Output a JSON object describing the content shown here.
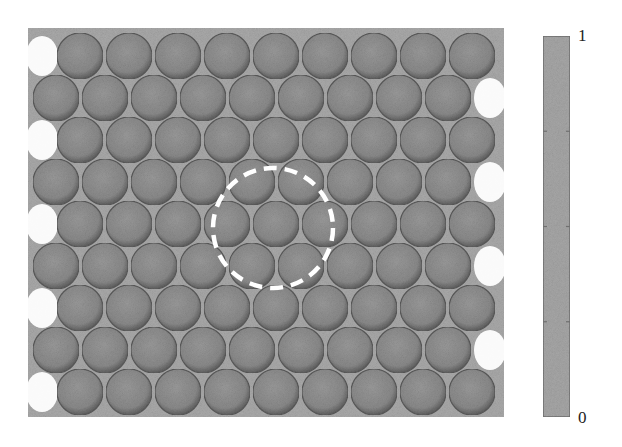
{
  "figure": {
    "title": "",
    "frame": {
      "x": 28,
      "y": 28,
      "width": 476,
      "height": 389,
      "fill": "#a9a9a9"
    },
    "sphere_color": "#8c8c8c",
    "sphere_edge_color": "#5a5a5a",
    "highlight_color": "#ffffff",
    "rows": [
      {
        "y": 56,
        "x_start": 80,
        "count": 9,
        "crescent": "left"
      },
      {
        "y": 98,
        "x_start": 56,
        "count": 9,
        "crescent": "right"
      },
      {
        "y": 140,
        "x_start": 80,
        "count": 9,
        "crescent": "left"
      },
      {
        "y": 182,
        "x_start": 56,
        "count": 9,
        "crescent": "right"
      },
      {
        "y": 224,
        "x_start": 80,
        "count": 9,
        "crescent": "left"
      },
      {
        "y": 266,
        "x_start": 56,
        "count": 9,
        "crescent": "right"
      },
      {
        "y": 308,
        "x_start": 80,
        "count": 9,
        "crescent": "left"
      },
      {
        "y": 350,
        "x_start": 56,
        "count": 9,
        "crescent": "right"
      },
      {
        "y": 392,
        "x_start": 80,
        "count": 9,
        "crescent": "left"
      }
    ],
    "column_pitch": 49,
    "sphere_radius": 23,
    "dashed_circle": {
      "cx": 273,
      "cy": 228,
      "r": 60,
      "color": "#ffffff",
      "label": "defect-region"
    }
  },
  "colorbar": {
    "x": 543,
    "y": 36,
    "width": 27,
    "height": 381,
    "fill": "#a6a6a6",
    "border": "#707070",
    "max_label": "1",
    "min_label": "0",
    "ticks_fraction": [
      0.25,
      0.5,
      0.75
    ]
  }
}
